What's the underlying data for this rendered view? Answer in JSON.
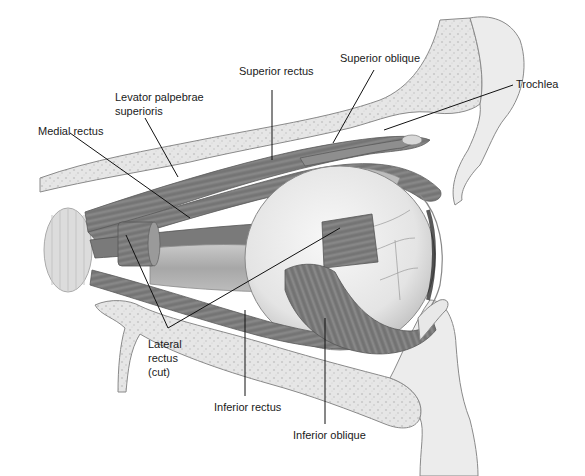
{
  "figure": {
    "colors": {
      "background": "#ffffff",
      "bone_fill": "#e4e4e4",
      "bone_texture": "#c8c8c8",
      "bone_outline": "#8a8a8a",
      "muscle_dark": "#6e6e6e",
      "muscle_mid": "#8c8c8c",
      "muscle_light": "#a8a8a8",
      "eyeball": "#eeeeee",
      "eyeball_shade": "#cfcfcf",
      "nerve": "#b9b9b9",
      "leader_line": "#111111",
      "label_text": "#1a1a1a"
    }
  },
  "labels": {
    "superior_rectus": "Superior rectus",
    "superior_oblique": "Superior oblique",
    "trochlea": "Trochlea",
    "levator_line1": "Levator palpebrae",
    "levator_line2": "superioris",
    "medial_rectus": "Medial rectus",
    "lateral_line1": "Lateral",
    "lateral_line2": "rectus",
    "lateral_line3": "(cut)",
    "inferior_rectus": "Inferior rectus",
    "inferior_oblique": "Inferior oblique"
  }
}
